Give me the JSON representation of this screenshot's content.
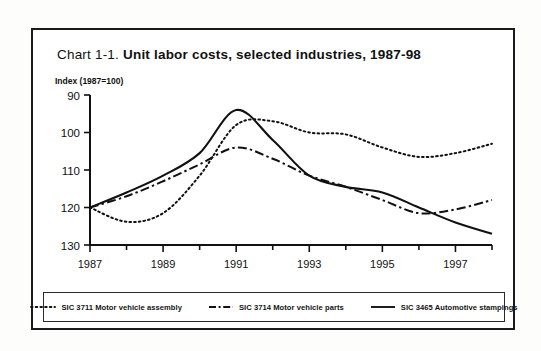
{
  "figure": {
    "title_lead": "Chart 1-1. ",
    "title_bold": "Unit labor costs, selected industries, 1987-98",
    "y_axis_label": "Index (1987=100)"
  },
  "chart_data": {
    "type": "line",
    "title": "Chart 1-1. Unit labor costs, selected industries, 1987-98",
    "xlabel": "",
    "ylabel": "Index (1987=100)",
    "xlim": [
      1987,
      1998
    ],
    "ylim": [
      90,
      130
    ],
    "yticks": [
      90,
      100,
      110,
      120,
      130
    ],
    "xticks": [
      1987,
      1989,
      1991,
      1993,
      1995,
      1997
    ],
    "xminorticks": [
      1988,
      1990,
      1992,
      1994,
      1996,
      1998
    ],
    "grid": false,
    "legend_position": "bottom",
    "x": [
      1987,
      1988,
      1989,
      1990,
      1991,
      1992,
      1993,
      1994,
      1995,
      1996,
      1997,
      1998
    ],
    "series": [
      {
        "name": "SIC 3711 Motor vehicle assembly",
        "style": "dotted",
        "values": [
          100.0,
          96.2,
          98.5,
          108.5,
          122.0,
          123.0,
          120.0,
          119.5,
          116.0,
          113.5,
          114.5,
          117.0
        ]
      },
      {
        "name": "SIC 3714 Motor vehicle parts",
        "style": "dash-dot",
        "values": [
          100.0,
          103.0,
          107.0,
          111.5,
          116.0,
          113.0,
          108.5,
          105.5,
          102.0,
          98.5,
          99.5,
          102.0
        ]
      },
      {
        "name": "SIC 3465 Automotive stampings",
        "style": "solid",
        "values": [
          100.0,
          104.0,
          108.5,
          114.5,
          126.0,
          118.0,
          108.5,
          105.5,
          104.0,
          100.0,
          96.0,
          93.0
        ]
      }
    ]
  },
  "axes": {
    "yticklabels": [
      "130",
      "120",
      "110",
      "100",
      "90"
    ],
    "xticklabels": [
      "1987",
      "1989",
      "1991",
      "1993",
      "1995",
      "1997"
    ]
  },
  "legend": {
    "entries": [
      {
        "label": "SIC 3711 Motor vehicle assembly",
        "icon": "dotted-line-swatch"
      },
      {
        "label": "SIC 3714 Motor vehicle parts",
        "icon": "dashdot-line-swatch"
      },
      {
        "label": "SIC 3465 Automotive stampings",
        "icon": "solid-line-swatch"
      }
    ]
  }
}
